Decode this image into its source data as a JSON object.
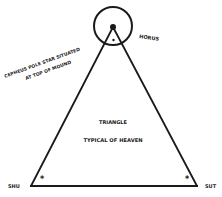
{
  "diagram": {
    "colors": {
      "ink": "#1a1a1a",
      "background": "#ffffff"
    },
    "labels": {
      "horus": "HORUS",
      "cepheus_line1": "CEPHEUS POLE STAR SITUATED",
      "cepheus_line2": "AT TOP OF MOUND",
      "triangle_title": "TRIANGLE",
      "triangle_subtitle": "TYPICAL OF HEAVEN",
      "shu": "SHU",
      "sut": "SUT"
    },
    "marks": {
      "apex_star": "•",
      "inner_star": "*",
      "left_star": "*",
      "right_star": "*"
    }
  }
}
